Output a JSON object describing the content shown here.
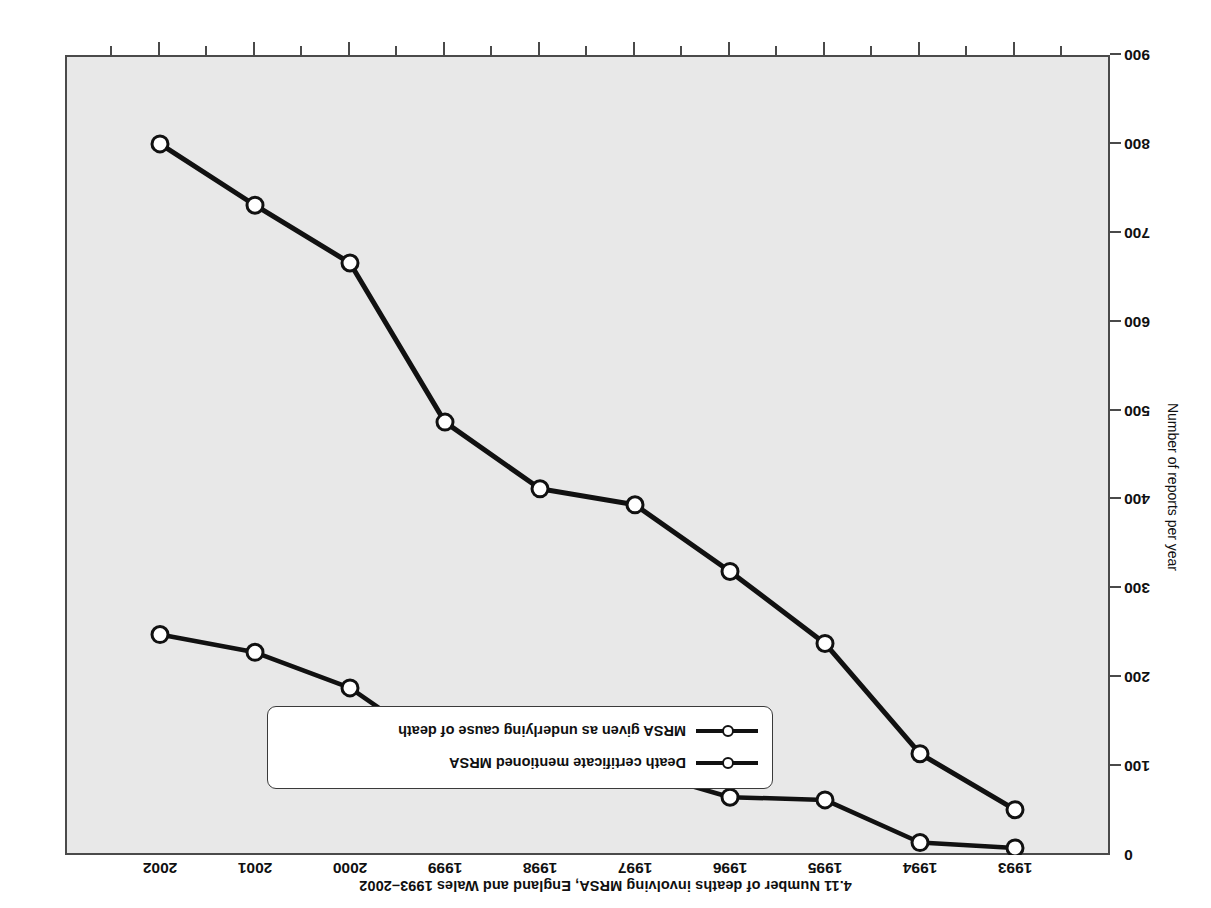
{
  "chart_data": {
    "type": "line",
    "title": "4.11 Number of deaths involving MRSA, England and Wales 1993–2002",
    "xlabel": "",
    "ylabel": "Number of reports per year",
    "categories": [
      "1993",
      "1994",
      "1995",
      "1996",
      "1997",
      "1998",
      "1999",
      "2000",
      "2001",
      "2002"
    ],
    "xticklabels": [
      "1993",
      "1994",
      "1995",
      "1996",
      "1997",
      "1998",
      "1999",
      "2000",
      "2001",
      "2002"
    ],
    "yticklabels": [
      "0",
      "100",
      "200",
      "300",
      "400",
      "500",
      "600",
      "700",
      "800",
      "900"
    ],
    "ytickvalues": [
      0,
      100,
      200,
      300,
      400,
      500,
      600,
      700,
      800,
      900
    ],
    "ylim": [
      0,
      900
    ],
    "grid": false,
    "legend_position": "lower-right-inside",
    "series": [
      {
        "name": "Death certificate mentioned MRSA",
        "values": [
          51,
          114,
          238,
          319,
          394,
          412,
          487,
          666,
          731,
          800
        ]
      },
      {
        "name": "MRSA given as underlying cause of death",
        "values": [
          8,
          14,
          62,
          65,
          96,
          105,
          114,
          188,
          228,
          248
        ]
      }
    ],
    "legend": [
      "Death certificate mentioned MRSA",
      "MRSA given as underlying cause of death"
    ],
    "colors": {
      "line": "#111111",
      "marker_fill": "#ffffff",
      "plot_background": "#e8e8e8",
      "frame": "#4a4a4a",
      "text": "#101010",
      "page_background": "#ffffff"
    }
  }
}
